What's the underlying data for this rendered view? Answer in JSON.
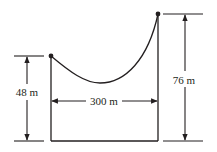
{
  "diagram": {
    "labels": {
      "left_height": "48 m",
      "right_height": "76 m",
      "span": "300 m"
    },
    "values": {
      "left_height_m": 48,
      "right_height_m": 76,
      "span_m": 300
    },
    "colors": {
      "ink": "#231f20",
      "background": "#ffffff"
    }
  }
}
